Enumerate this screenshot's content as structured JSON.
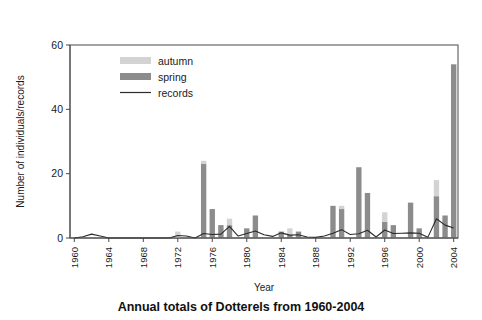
{
  "chart_data": {
    "type": "bar",
    "title": "Annual totals of Dotterels from 1960-2004",
    "xlabel": "Year",
    "ylabel": "Number of individuals/records",
    "ylim": [
      0,
      60
    ],
    "yticks": [
      0,
      20,
      40,
      60
    ],
    "xlim": [
      1959.5,
      2004.5
    ],
    "xticks": [
      1960,
      1964,
      1968,
      1972,
      1976,
      1980,
      1984,
      1988,
      1992,
      1996,
      2000,
      2004
    ],
    "grid": false,
    "legend_position": "top-left",
    "stacked": true,
    "categories": [
      1960,
      1961,
      1962,
      1963,
      1964,
      1965,
      1966,
      1967,
      1968,
      1969,
      1970,
      1971,
      1972,
      1973,
      1974,
      1975,
      1976,
      1977,
      1978,
      1979,
      1980,
      1981,
      1982,
      1983,
      1984,
      1985,
      1986,
      1987,
      1988,
      1989,
      1990,
      1991,
      1992,
      1993,
      1994,
      1995,
      1996,
      1997,
      1998,
      1999,
      2000,
      2001,
      2002,
      2003,
      2004
    ],
    "series": [
      {
        "name": "spring",
        "color": "#8c8c8c",
        "values": [
          0,
          0,
          0,
          0,
          0,
          0,
          0,
          0,
          0,
          0,
          0,
          0,
          0,
          0,
          0,
          23,
          9,
          4,
          4,
          0,
          3,
          7,
          0,
          0,
          2,
          1,
          2,
          0,
          0,
          0,
          10,
          9,
          0,
          22,
          14,
          0,
          5,
          4,
          0,
          11,
          3,
          0,
          13,
          7,
          54
        ]
      },
      {
        "name": "autumn",
        "color": "#d3d3d3",
        "values": [
          0,
          0,
          0,
          0,
          0,
          0,
          0,
          0,
          0,
          0,
          0,
          0,
          2,
          0,
          0,
          1,
          0,
          0,
          2,
          0,
          0,
          0,
          0,
          0,
          0,
          2,
          0,
          0,
          0,
          0,
          0,
          1,
          0,
          0,
          0,
          0,
          3,
          0,
          0,
          0,
          0,
          0,
          5,
          0,
          0
        ]
      }
    ],
    "records_line": {
      "name": "records",
      "color": "#2b2b2b",
      "values": [
        0,
        0.4,
        1.2,
        0.6,
        0,
        0,
        0,
        0,
        0,
        0,
        0,
        0,
        0.8,
        0.6,
        0,
        1.4,
        1.1,
        1.2,
        3.6,
        0.6,
        1.4,
        2.2,
        1.0,
        0.5,
        1.6,
        0.9,
        1.0,
        0.3,
        0.2,
        0.6,
        1.5,
        2.6,
        1.1,
        1.3,
        2.4,
        0.3,
        2.5,
        1.4,
        1.5,
        1.6,
        1.5,
        0.2,
        6.0,
        4.0,
        3.1
      ]
    },
    "legend": [
      {
        "label": "autumn",
        "marker": "swatch",
        "color": "#d3d3d3"
      },
      {
        "label": "spring",
        "marker": "swatch",
        "color": "#8c8c8c"
      },
      {
        "label": "records",
        "marker": "line",
        "color": "#2b2b2b"
      }
    ]
  }
}
